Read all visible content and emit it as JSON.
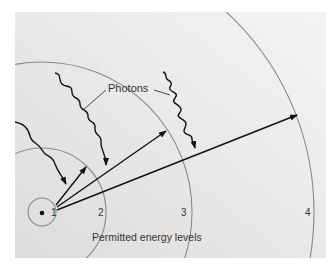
{
  "diagram": {
    "photon_label": "Photons",
    "levels_label": "Permitted energy levels",
    "levels": [
      {
        "n": "1",
        "radius": 14
      },
      {
        "n": "2",
        "radius": 64
      },
      {
        "n": "3",
        "radius": 150
      },
      {
        "n": "4",
        "radius": 272
      }
    ],
    "nucleus": {
      "x": 42,
      "y": 212
    },
    "colors": {
      "background": "#e7e7e7",
      "orbit": "#8a8a8a",
      "ink": "#111111",
      "text": "#333333"
    }
  }
}
